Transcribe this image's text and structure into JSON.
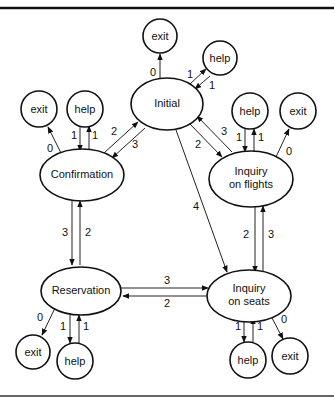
{
  "diagram": {
    "title": "",
    "nodes": {
      "initial": {
        "label": "Initial"
      },
      "exit_initial": {
        "label": "exit"
      },
      "help_initial": {
        "label": "help"
      },
      "confirmation": {
        "label": "Confirmation"
      },
      "exit_confirmation": {
        "label": "exit"
      },
      "help_confirmation": {
        "label": "help"
      },
      "flights": {
        "label1": "Inquiry",
        "label2": "on flights"
      },
      "help_flights": {
        "label": "help"
      },
      "exit_flights": {
        "label": "exit"
      },
      "reservation": {
        "label": "Reservation"
      },
      "exit_reservation": {
        "label": "exit"
      },
      "help_reservation": {
        "label": "help"
      },
      "seats": {
        "label1": "Inquiry",
        "label2": "on seats"
      },
      "help_seats": {
        "label": "help"
      },
      "exit_seats": {
        "label": "exit"
      }
    },
    "edges": {
      "initial_exit": "0",
      "initial_help": "1",
      "help_initial": "1",
      "confirmation_exit": "0",
      "confirmation_help": "1",
      "help_confirmation": "1",
      "confirmation_initial": "2",
      "initial_confirmation": "3",
      "initial_flights": "2",
      "flights_initial": "3",
      "flights_help": "1",
      "help_flights": "1",
      "flights_exit": "0",
      "initial_seats": "4",
      "confirmation_reservation": "3",
      "reservation_confirmation": "2",
      "flights_seats": "2",
      "seats_flights": "3",
      "reservation_seats": "3",
      "seats_reservation": "2",
      "reservation_exit": "0",
      "reservation_help": "1",
      "help_reservation": "1",
      "seats_help": "1",
      "help_seats": "1",
      "seats_exit": "0"
    }
  }
}
